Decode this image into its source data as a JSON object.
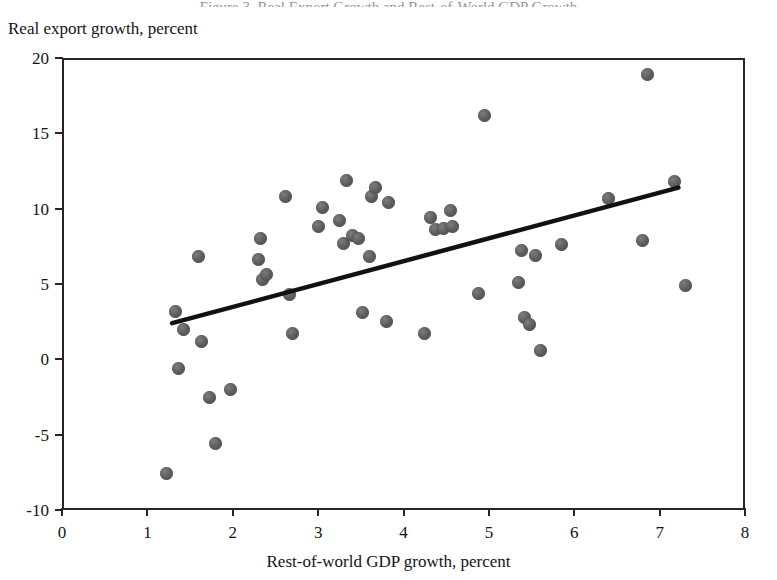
{
  "figure": {
    "clipped_title": "Figure 3. Real Export Growth and Rest-of-World GDP Growth",
    "background_color": "#ffffff",
    "marker_color": "#585858",
    "axis_color": "#262626",
    "trendline_color": "#111111"
  },
  "chart_data": {
    "type": "scatter",
    "title": "",
    "xlabel": "Rest-of-world GDP growth, percent",
    "ylabel": "Real export growth, percent",
    "xlim": [
      0,
      8
    ],
    "ylim": [
      -10,
      20
    ],
    "xticks": [
      0,
      1,
      2,
      3,
      4,
      5,
      6,
      7,
      8
    ],
    "yticks": [
      -10,
      -5,
      0,
      5,
      10,
      15,
      20
    ],
    "xtick_labels": [
      "0",
      "1",
      "2",
      "3",
      "4",
      "5",
      "6",
      "7",
      "8"
    ],
    "ytick_labels": [
      "-10",
      "-5",
      "0",
      "5",
      "10",
      "15",
      "20"
    ],
    "grid": false,
    "legend": false,
    "legend_position": "none",
    "series": [
      {
        "name": "Observations",
        "type": "scatter",
        "marker": "circle",
        "color": "#585858",
        "points": [
          [
            1.22,
            -7.6
          ],
          [
            1.33,
            3.2
          ],
          [
            1.37,
            -0.6
          ],
          [
            1.42,
            2.0
          ],
          [
            1.6,
            6.8
          ],
          [
            1.63,
            1.2
          ],
          [
            1.73,
            -2.5
          ],
          [
            1.8,
            -5.6
          ],
          [
            1.97,
            -2.0
          ],
          [
            2.3,
            6.6
          ],
          [
            2.33,
            8.0
          ],
          [
            2.35,
            5.3
          ],
          [
            2.4,
            5.6
          ],
          [
            2.62,
            10.8
          ],
          [
            2.67,
            4.3
          ],
          [
            2.7,
            1.7
          ],
          [
            3.0,
            8.8
          ],
          [
            3.05,
            10.1
          ],
          [
            3.25,
            9.2
          ],
          [
            3.3,
            7.7
          ],
          [
            3.33,
            11.9
          ],
          [
            3.4,
            8.2
          ],
          [
            3.47,
            8.0
          ],
          [
            3.52,
            3.1
          ],
          [
            3.6,
            6.8
          ],
          [
            3.62,
            10.8
          ],
          [
            3.67,
            11.4
          ],
          [
            3.8,
            2.5
          ],
          [
            3.83,
            10.4
          ],
          [
            4.25,
            1.7
          ],
          [
            4.32,
            9.4
          ],
          [
            4.38,
            8.6
          ],
          [
            4.47,
            8.7
          ],
          [
            4.55,
            9.9
          ],
          [
            4.57,
            8.8
          ],
          [
            4.88,
            4.4
          ],
          [
            4.95,
            16.2
          ],
          [
            5.35,
            5.1
          ],
          [
            5.38,
            7.2
          ],
          [
            5.42,
            2.8
          ],
          [
            5.48,
            2.3
          ],
          [
            5.55,
            6.9
          ],
          [
            5.6,
            0.6
          ],
          [
            5.85,
            7.6
          ],
          [
            6.4,
            10.7
          ],
          [
            6.8,
            7.9
          ],
          [
            6.86,
            18.9
          ],
          [
            7.18,
            11.8
          ],
          [
            7.3,
            4.9
          ]
        ]
      }
    ],
    "trendline": {
      "name": "Linear fit",
      "type": "line",
      "color": "#111111",
      "x_start": 1.29,
      "y_start": 2.4,
      "x_end": 7.22,
      "y_end": 11.4
    }
  }
}
